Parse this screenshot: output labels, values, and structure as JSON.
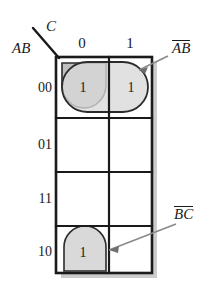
{
  "diagram": {
    "type": "karnaugh-map",
    "variables": {
      "row_var": "AB",
      "col_var": "C"
    },
    "column_headers": [
      "0",
      "1"
    ],
    "row_headers": [
      "00",
      "01",
      "11",
      "10"
    ],
    "cells": [
      {
        "row": "00",
        "col": "0",
        "value": "1"
      },
      {
        "row": "00",
        "col": "1",
        "value": "1"
      },
      {
        "row": "01",
        "col": "0",
        "value": ""
      },
      {
        "row": "01",
        "col": "1",
        "value": ""
      },
      {
        "row": "11",
        "col": "0",
        "value": ""
      },
      {
        "row": "11",
        "col": "1",
        "value": ""
      },
      {
        "row": "10",
        "col": "0",
        "value": "1"
      },
      {
        "row": "10",
        "col": "1",
        "value": ""
      }
    ],
    "groups": [
      {
        "id": "group-ab",
        "label_letters": [
          "A",
          "B"
        ],
        "label_plain": "AB",
        "overbars": [
          true,
          true
        ],
        "covers": [
          "00-0",
          "00-1"
        ],
        "fill": "#d9d9d9",
        "stroke": "#2b2b2b"
      },
      {
        "id": "group-bc",
        "label_letters": [
          "B",
          "C"
        ],
        "label_plain": "BC",
        "overbars": [
          true,
          true
        ],
        "covers": [
          "00-0",
          "10-0"
        ],
        "fill": "#bdbdbd",
        "stroke": "#2b2b2b"
      }
    ],
    "colors": {
      "grid_line": "#1a1a1a",
      "shadow": "#c8c8c8",
      "group_light_fill": "#d9d9d9",
      "group_dark_fill": "#bfbfbf",
      "group_stroke": "#2b2b2b",
      "leader_line": "#8a8a8a",
      "text": "#1a1a1a",
      "background": "#ffffff"
    }
  }
}
